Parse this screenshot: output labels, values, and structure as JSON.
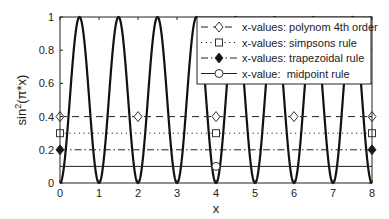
{
  "chart_data": {
    "type": "line",
    "title": "",
    "xlabel": "x",
    "ylabel": "sin²(π*x)",
    "ylabel_parts": {
      "base": "sin",
      "sup": "2",
      "rest": "(π*x)"
    },
    "xlim": [
      0,
      8
    ],
    "ylim": [
      0,
      1
    ],
    "grid": false,
    "legend_position": "top-right",
    "xticks": [
      0,
      1,
      2,
      3,
      4,
      5,
      6,
      7,
      8
    ],
    "xtick_labels": [
      "0",
      "1",
      "2",
      "3",
      "4",
      "5",
      "6",
      "7",
      "8"
    ],
    "yticks": [
      0,
      0.2,
      0.4,
      0.6,
      0.8,
      1
    ],
    "ytick_labels": [
      "0",
      "0.2",
      "0.4",
      "0.6",
      "0.8",
      "1"
    ],
    "curve": {
      "name": "sin^2(pi*x)",
      "function": "sin(pi*x)^2",
      "x_range": [
        0,
        8
      ],
      "color": "#111111"
    },
    "series": [
      {
        "name": "x-values: polynom 4th order",
        "style": "dashed",
        "marker": "diamond-open",
        "level": 0.4,
        "x": [
          0,
          2,
          4,
          6,
          8
        ],
        "y": [
          0.4,
          0.4,
          0.4,
          0.4,
          0.4
        ]
      },
      {
        "name": "x-values: simpsons rule",
        "style": "dotted",
        "marker": "square-open",
        "level": 0.3,
        "x": [
          0,
          4,
          8
        ],
        "y": [
          0.3,
          0.3,
          0.3
        ]
      },
      {
        "name": "x-values: trapezoidal rule",
        "style": "dashdot",
        "marker": "diamond-filled",
        "level": 0.2,
        "x": [
          0,
          8
        ],
        "y": [
          0.2,
          0.2
        ]
      },
      {
        "name": "x-value:  midpoint rule",
        "style": "solid",
        "marker": "circle-open",
        "level": 0.1,
        "x": [
          4
        ],
        "y": [
          0.1
        ]
      }
    ]
  }
}
